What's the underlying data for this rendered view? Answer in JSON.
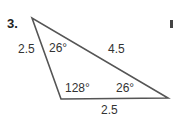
{
  "problem": {
    "number": "3."
  },
  "triangle": {
    "vertices": {
      "top": [
        32,
        18
      ],
      "bottom_left": [
        61,
        99
      ],
      "right": [
        168,
        98
      ]
    },
    "sides": {
      "left": "2.5",
      "hypotenuse": "4.5",
      "bottom": "2.5"
    },
    "angles": {
      "top": "26°",
      "bottom_left": "128°",
      "right": "26°"
    },
    "stroke_color": "#555555"
  }
}
